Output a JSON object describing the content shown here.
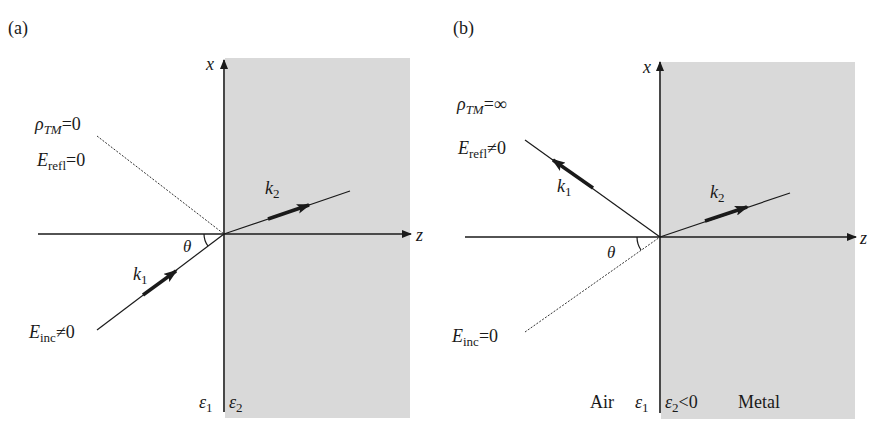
{
  "colors": {
    "medium2_fill": "#d9d9d9",
    "line": "#1a1a1a",
    "background": "#ffffff"
  },
  "panel_a": {
    "tag": "(a)",
    "axis_x": "x",
    "axis_z": "z",
    "rho_sym": "ρ",
    "rho_sub": "TM",
    "rho_rel": "=0",
    "refl_sym": "E",
    "refl_sub": "refl",
    "refl_rel": "=0",
    "inc_sym": "E",
    "inc_sub": "inc",
    "inc_rel": "≠0",
    "k1_sym": "k",
    "k1_sub": "1",
    "k2_sym": "k",
    "k2_sub": "2",
    "theta": "θ",
    "eps1_sym": "ε",
    "eps1_sub": "1",
    "eps2_sym": "ε",
    "eps2_sub": "2"
  },
  "panel_b": {
    "tag": "(b)",
    "axis_x": "x",
    "axis_z": "z",
    "rho_sym": "ρ",
    "rho_sub": "TM",
    "rho_rel": "=∞",
    "refl_sym": "E",
    "refl_sub": "refl",
    "refl_rel": "≠0",
    "inc_sym": "E",
    "inc_sub": "inc",
    "inc_rel": "=0",
    "k1_sym": "k",
    "k1_sub": "1",
    "k2_sym": "k",
    "k2_sub": "2",
    "theta": "θ",
    "air_label": "Air",
    "eps1_sym": "ε",
    "eps1_sub": "1",
    "eps2_sym": "ε",
    "eps2_sub": "2",
    "eps2_rel": "<0",
    "metal_label": "Metal"
  }
}
